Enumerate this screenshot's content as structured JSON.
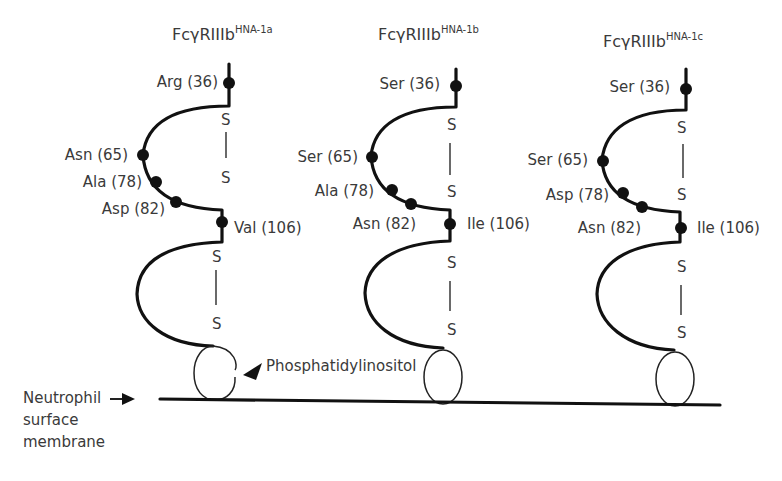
{
  "figure": {
    "variants": [
      {
        "title": "FcγRIIIb",
        "superscript": "HNA-1a",
        "residues": [
          {
            "label": "Arg (36)"
          },
          {
            "label": "Asn (65)"
          },
          {
            "label": "Ala (78)"
          },
          {
            "label": "Asp (82)"
          },
          {
            "label": "Val (106)"
          }
        ]
      },
      {
        "title": "FcγRIIIb",
        "superscript": "HNA-1b",
        "residues": [
          {
            "label": "Ser (36)"
          },
          {
            "label": "Ser (65)"
          },
          {
            "label": "Ala (78)"
          },
          {
            "label": "Asn (82)"
          },
          {
            "label": "Ile (106)"
          }
        ]
      },
      {
        "title": "FcγRIIIb",
        "superscript": "HNA-1c",
        "residues": [
          {
            "label": "Ser (36)"
          },
          {
            "label": "Ser (65)"
          },
          {
            "label": "Asp (78)"
          },
          {
            "label": "Asn (82)"
          },
          {
            "label": "Ile (106)"
          }
        ]
      }
    ],
    "disulfide_label": "S",
    "anchor_label": "Phosphatidylinositol",
    "membrane_label_lines": [
      "Neutrophil",
      "surface",
      "membrane"
    ],
    "colors": {
      "ink": "#111111",
      "text": "#3a3a3a",
      "background": "#ffffff"
    }
  }
}
